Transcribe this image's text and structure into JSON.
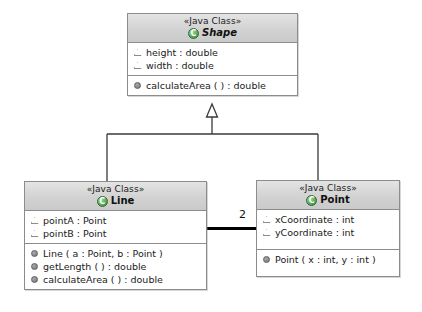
{
  "diagram": {
    "type": "UML Class Diagram",
    "background_color": "#ffffff",
    "classes": [
      {
        "id": "shape",
        "stereotype": "«Java Class»",
        "name": "Shape",
        "abstract": true,
        "icon": "java-class-icon",
        "attributes": [
          {
            "visibility": "protected",
            "text": "height : double"
          },
          {
            "visibility": "protected",
            "text": "width : double"
          }
        ],
        "operations": [
          {
            "visibility": "public",
            "text": "calculateArea ( ) : double"
          }
        ]
      },
      {
        "id": "line",
        "stereotype": "«Java Class»",
        "name": "Line",
        "abstract": false,
        "icon": "java-class-icon",
        "attributes": [
          {
            "visibility": "protected",
            "text": "pointA : Point"
          },
          {
            "visibility": "protected",
            "text": "pointB : Point"
          }
        ],
        "operations": [
          {
            "visibility": "public",
            "text": "Line ( a : Point, b : Point )"
          },
          {
            "visibility": "public",
            "text": "getLength ( ) : double"
          },
          {
            "visibility": "public",
            "text": "calculateArea ( ) : double"
          }
        ]
      },
      {
        "id": "point",
        "stereotype": "«Java Class»",
        "name": "Point",
        "abstract": false,
        "icon": "java-class-icon",
        "attributes": [
          {
            "visibility": "protected",
            "text": "xCoordinate : int"
          },
          {
            "visibility": "protected",
            "text": "yCoordinate : int"
          }
        ],
        "operations": [
          {
            "visibility": "public",
            "text": "Point ( x : int, y : int )"
          }
        ]
      }
    ],
    "relationships": [
      {
        "kind": "generalization",
        "from": "line",
        "to": "shape",
        "arrow": "hollow-triangle"
      },
      {
        "kind": "generalization",
        "from": "point",
        "to": "shape",
        "arrow": "hollow-triangle"
      },
      {
        "kind": "association",
        "from": "line",
        "to": "point",
        "multiplicity_target": "2"
      }
    ]
  },
  "labels": {
    "stereotype_shape": "«Java Class»",
    "stereotype_line": "«Java Class»",
    "stereotype_point": "«Java Class»",
    "name_shape": "Shape",
    "name_line": "Line",
    "name_point": "Point",
    "shape_attr_0": "height : double",
    "shape_attr_1": "width : double",
    "shape_op_0": "calculateArea ( ) : double",
    "line_attr_0": "pointA : Point",
    "line_attr_1": "pointB : Point",
    "line_op_0": "Line ( a : Point, b : Point )",
    "line_op_1": "getLength ( ) : double",
    "line_op_2": "calculateArea ( ) : double",
    "point_attr_0": "xCoordinate : int",
    "point_attr_1": "yCoordinate : int",
    "point_op_0": "Point ( x : int, y : int )",
    "association_multiplicity": "2"
  }
}
